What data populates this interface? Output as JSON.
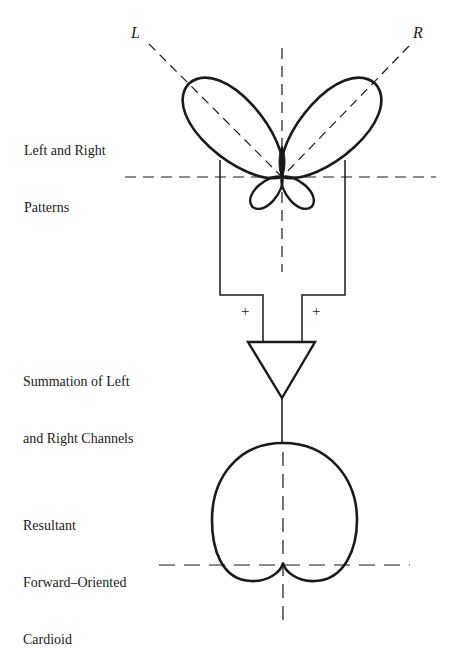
{
  "diagram": {
    "axis_labels": {
      "left": "L",
      "right": "R"
    },
    "captions": {
      "patterns": {
        "line1": "Left and Right",
        "line2": "Patterns"
      },
      "summation": {
        "line1": "Summation of Left",
        "line2": "and Right Channels"
      },
      "result": {
        "line1": "Resultant",
        "line2": "Forward–Oriented",
        "line3": "Cardioid"
      }
    },
    "input_signs": {
      "left": "+",
      "right": "+"
    },
    "colors": {
      "ink": "#1a1a1a",
      "background": "#ffffff"
    }
  }
}
